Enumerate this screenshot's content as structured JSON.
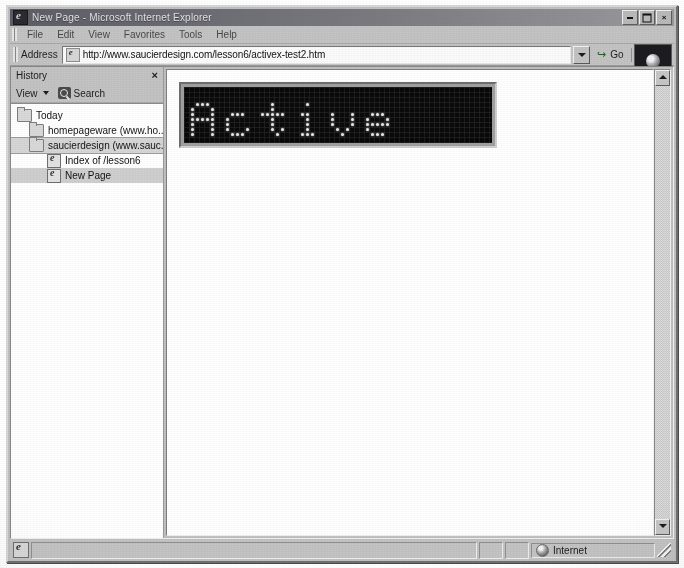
{
  "window": {
    "title": "New Page - Microsoft Internet Explorer",
    "icon": "ie-document-icon",
    "controls": {
      "minimize": "_",
      "maximize": "□",
      "close": "×"
    }
  },
  "menu": {
    "items": [
      {
        "label": "File"
      },
      {
        "label": "Edit"
      },
      {
        "label": "View"
      },
      {
        "label": "Favorites"
      },
      {
        "label": "Tools"
      },
      {
        "label": "Help"
      }
    ]
  },
  "address_bar": {
    "label": "Address",
    "url": "http://www.saucierdesign.com/lesson6/activex-test2.htm",
    "placeholder": "http://",
    "go_label": "Go",
    "go_icon": "go-arrow-icon",
    "links_label": "Links",
    "links_chevron": "»",
    "dropdown_icon": "chevron-down-icon",
    "favicon": "ie-page-icon"
  },
  "history_panel": {
    "title": "History",
    "close_label": "×",
    "view_label": "View",
    "view_caret_icon": "chevron-down-icon",
    "search_label": "Search",
    "search_icon": "search-icon",
    "tree": [
      {
        "label": "Today",
        "icon": "folder-icon",
        "level": 1,
        "selected": false
      },
      {
        "label": "homepageware (www.ho...",
        "icon": "folder-icon",
        "level": 2,
        "selected": false
      },
      {
        "label": "saucierdesign (www.sauc...",
        "icon": "folder-icon",
        "level": 2,
        "selected": true
      },
      {
        "label": "Index of /lesson6",
        "icon": "page-icon",
        "level": 3,
        "selected": false
      },
      {
        "label": "New Page",
        "icon": "page-icon",
        "level": 3,
        "selected": true
      }
    ]
  },
  "document": {
    "marquee": {
      "text": "Active",
      "display_type": "led-dot-matrix",
      "led_color": "#e8e8e8",
      "background_color": "#0a0a0a",
      "bezel_color": "#9f9f9f"
    }
  },
  "scrollbar": {
    "up_icon": "scroll-up-icon",
    "down_icon": "scroll-down-icon"
  },
  "status_bar": {
    "icon": "ie-page-icon",
    "message": "",
    "zone_label": "Internet",
    "zone_icon": "globe-icon"
  },
  "colors": {
    "titlebar_start": "#5d5d66",
    "titlebar_end": "#9a9a9e",
    "window_face": "#c3c3c3",
    "document_bg": "#ffffff",
    "led_on": "#e8e8e8"
  }
}
